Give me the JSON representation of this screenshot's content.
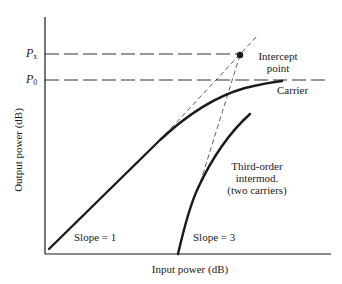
{
  "diagram": {
    "x_axis_label": "Input power (dB)",
    "y_axis_label": "Output power (dB)",
    "levels": [
      {
        "symbol": "P",
        "subscript": "x",
        "y": 54
      },
      {
        "symbol": "P",
        "subscript": "0",
        "y": 80
      }
    ],
    "annotations": {
      "intercept": [
        "Intercept",
        "point"
      ],
      "carrier": "Carrier",
      "intermod": [
        "Third-order",
        "intermod.",
        "(two carriers)"
      ],
      "slope1": "Slope = 1",
      "slope3": "Slope = 3"
    },
    "curves": [
      {
        "name": "carrier",
        "description": "fundamental output, linear slope 1 then saturating toward P0"
      },
      {
        "name": "third-order-intermod",
        "description": "third-order intermodulation product, slope 3"
      }
    ],
    "intercept_point": {
      "x": 240,
      "y": 55
    },
    "colors": {
      "ink": "#1a1a1a",
      "background": "#ffffff"
    }
  }
}
